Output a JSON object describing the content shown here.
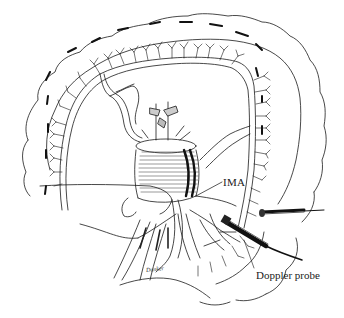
{
  "figure": {
    "type": "surgical illustration",
    "labels": {
      "ima": "IMA",
      "doppler_probe": "Doppler probe",
      "signature": "Dunker"
    },
    "colors": {
      "ink": "#1a1a1a",
      "background": "#ffffff",
      "shade": "#555555"
    }
  }
}
